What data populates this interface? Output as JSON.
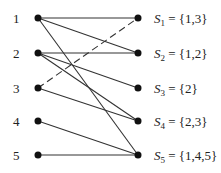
{
  "diagram": {
    "type": "bipartite-graph",
    "left_nodes": [
      {
        "id": "1",
        "label": "1",
        "y": 18
      },
      {
        "id": "2",
        "label": "2",
        "y": 53
      },
      {
        "id": "3",
        "label": "3",
        "y": 88
      },
      {
        "id": "4",
        "label": "4",
        "y": 121
      },
      {
        "id": "5",
        "label": "5",
        "y": 155
      }
    ],
    "right_nodes": [
      {
        "id": "S1",
        "name": "S",
        "sub": "1",
        "set": " = {1,3}",
        "y": 18
      },
      {
        "id": "S2",
        "name": "S",
        "sub": "2",
        "set": " = {1,2}",
        "y": 53
      },
      {
        "id": "S3",
        "name": "S",
        "sub": "3",
        "set": " = {2}",
        "y": 88
      },
      {
        "id": "S4",
        "name": "S",
        "sub": "4",
        "set": " = {2,3}",
        "y": 121
      },
      {
        "id": "S5",
        "name": "S",
        "sub": "5",
        "set": " = {1,4,5}",
        "y": 155
      }
    ],
    "edges": [
      {
        "from": "1",
        "to": "S1",
        "style": "solid"
      },
      {
        "from": "1",
        "to": "S2",
        "style": "solid"
      },
      {
        "from": "1",
        "to": "S5",
        "style": "solid"
      },
      {
        "from": "2",
        "to": "S2",
        "style": "solid"
      },
      {
        "from": "2",
        "to": "S3",
        "style": "solid"
      },
      {
        "from": "2",
        "to": "S4",
        "style": "solid"
      },
      {
        "from": "3",
        "to": "S1",
        "style": "dashed"
      },
      {
        "from": "3",
        "to": "S4",
        "style": "solid"
      },
      {
        "from": "4",
        "to": "S5",
        "style": "solid"
      },
      {
        "from": "5",
        "to": "S5",
        "style": "solid"
      }
    ],
    "colors": {
      "line": "#333333",
      "node": "#111111",
      "text": "#222222"
    }
  }
}
